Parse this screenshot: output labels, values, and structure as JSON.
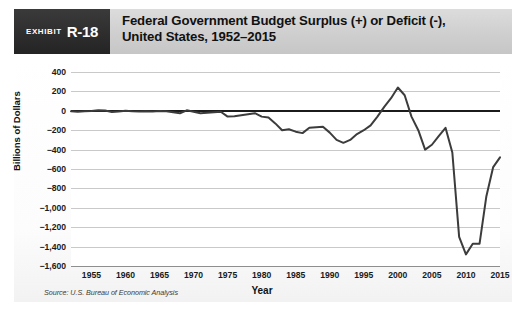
{
  "exhibit": {
    "word": "Exhibit",
    "number": "R-18"
  },
  "header": {
    "title_line1": "Federal Government Budget Surplus (+) or Deficit (-),",
    "title_line2": "United States, 1952–2015"
  },
  "source": "Source: U.S. Bureau of Economic Analysis",
  "colors": {
    "exhibit_box": "#2b2b2b",
    "header_band": "#d2d2d2",
    "line": "#3c3c3c",
    "gridline": "#c9c9c9",
    "zeroline": "#1b1b1b",
    "plot_background": "#ffffff"
  },
  "chart_data": {
    "type": "line",
    "title": "Federal Government Budget Surplus (+) or Deficit (-), United States, 1952–2015",
    "xlabel": "Year",
    "ylabel": "Billions of Dollars",
    "xlim": [
      1952,
      2015
    ],
    "ylim": [
      -1600,
      400
    ],
    "grid": true,
    "legend": false,
    "ytick_labels": [
      "400",
      "200",
      "0",
      "−200",
      "−400",
      "−600",
      "−800",
      "−1,000",
      "−1,200",
      "−1,400",
      "−1,600"
    ],
    "ytick_values": [
      400,
      200,
      0,
      -200,
      -400,
      -600,
      -800,
      -1000,
      -1200,
      -1400,
      -1600
    ],
    "xtick_labels": [
      "1955",
      "1960",
      "1965",
      "1970",
      "1975",
      "1980",
      "1985",
      "1990",
      "1995",
      "2000",
      "2005",
      "2010",
      "2015"
    ],
    "xtick_values": [
      1955,
      1960,
      1965,
      1970,
      1975,
      1980,
      1985,
      1990,
      1995,
      2000,
      2005,
      2010,
      2015
    ],
    "series": [
      {
        "name": "Federal budget surplus or deficit",
        "x": [
          1952,
          1953,
          1954,
          1955,
          1956,
          1957,
          1958,
          1959,
          1960,
          1961,
          1962,
          1963,
          1964,
          1965,
          1966,
          1967,
          1968,
          1969,
          1970,
          1971,
          1972,
          1973,
          1974,
          1975,
          1976,
          1977,
          1978,
          1979,
          1980,
          1981,
          1982,
          1983,
          1984,
          1985,
          1986,
          1987,
          1988,
          1989,
          1990,
          1991,
          1992,
          1993,
          1994,
          1995,
          1996,
          1997,
          1998,
          1999,
          2000,
          2001,
          2002,
          2003,
          2004,
          2005,
          2006,
          2007,
          2008,
          2009,
          2010,
          2011,
          2012,
          2013,
          2014,
          2015
        ],
        "values": [
          -5,
          -10,
          -5,
          -3,
          5,
          3,
          -12,
          -8,
          0,
          -5,
          -8,
          -5,
          -6,
          -3,
          -5,
          -15,
          -25,
          5,
          -10,
          -25,
          -20,
          -15,
          -10,
          -60,
          -55,
          -45,
          -35,
          -25,
          -60,
          -70,
          -130,
          -200,
          -190,
          -215,
          -230,
          -175,
          -170,
          -165,
          -225,
          -300,
          -330,
          -300,
          -240,
          -200,
          -150,
          -60,
          40,
          130,
          240,
          160,
          -60,
          -200,
          -400,
          -350,
          -260,
          -175,
          -430,
          -1300,
          -1480,
          -1370,
          -1370,
          -880,
          -580,
          -480
        ]
      }
    ],
    "annotations": [
      {
        "label": "peak surplus",
        "year": 2000,
        "value": 240
      },
      {
        "label": "trough deficit",
        "year": 2010,
        "value": -1480
      }
    ]
  }
}
